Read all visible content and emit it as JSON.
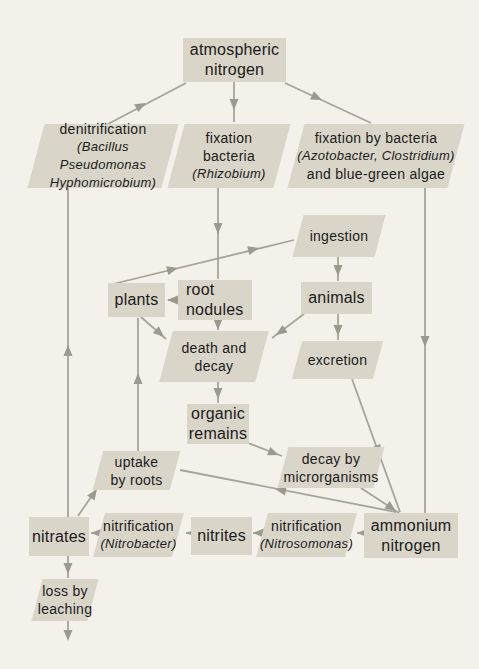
{
  "diagram": {
    "colors": {
      "background": "#f3f1e9",
      "node_fill": "#d9d5c8",
      "line": "#a7a49b",
      "arrowhead": "#9c998f",
      "text": "#1b1b1b"
    },
    "nodes": {
      "atmospheric_nitrogen": {
        "shape": "box",
        "lines": [
          "atmospheric",
          "nitrogen"
        ]
      },
      "denitrification": {
        "shape": "parallelogram",
        "lines": [
          "denitrification",
          "(Bacillus Pseudomonas",
          "Hyphomicrobium)"
        ]
      },
      "fixation_bacteria": {
        "shape": "parallelogram",
        "lines": [
          "fixation",
          "bacteria",
          "(Rhizobium)"
        ]
      },
      "fixation_by_bacteria": {
        "shape": "parallelogram",
        "lines": [
          "fixation by bacteria",
          "(Azotobacter, Clostridium)",
          "and blue-green algae"
        ]
      },
      "ingestion": {
        "shape": "parallelogram",
        "lines": [
          "ingestion"
        ]
      },
      "plants": {
        "shape": "box",
        "lines": [
          "plants"
        ]
      },
      "root_nodules": {
        "shape": "box",
        "lines": [
          "root",
          "nodules"
        ]
      },
      "animals": {
        "shape": "box",
        "lines": [
          "animals"
        ]
      },
      "death_and_decay": {
        "shape": "parallelogram",
        "lines": [
          "death and",
          "decay"
        ]
      },
      "excretion": {
        "shape": "parallelogram",
        "lines": [
          "excretion"
        ]
      },
      "organic_remains": {
        "shape": "box",
        "lines": [
          "organic",
          "remains"
        ]
      },
      "uptake_by_roots": {
        "shape": "parallelogram",
        "lines": [
          "uptake",
          "by roots"
        ]
      },
      "decay_by_microrganisms": {
        "shape": "parallelogram",
        "lines": [
          "decay by",
          "microrganisms"
        ]
      },
      "nitrates": {
        "shape": "box",
        "lines": [
          "nitrates"
        ]
      },
      "nitrification_nitrobacter": {
        "shape": "parallelogram",
        "lines": [
          "nitrification",
          "(Nitrobacter)"
        ]
      },
      "nitrites": {
        "shape": "box",
        "lines": [
          "nitrites"
        ]
      },
      "nitrification_nitrosomonas": {
        "shape": "parallelogram",
        "lines": [
          "nitrification",
          "(Nitrosomonas)"
        ]
      },
      "ammonium_nitrogen": {
        "shape": "box",
        "lines": [
          "ammonium",
          "nitrogen"
        ]
      },
      "loss_by_leaching": {
        "shape": "parallelogram",
        "lines": [
          "loss by",
          "leaching"
        ]
      }
    },
    "edges": [
      {
        "from": "denitrification",
        "to": "atmospheric_nitrogen"
      },
      {
        "from": "atmospheric_nitrogen",
        "to": "fixation_bacteria"
      },
      {
        "from": "atmospheric_nitrogen",
        "to": "fixation_by_bacteria"
      },
      {
        "from": "nitrates",
        "to": "denitrification"
      },
      {
        "from": "fixation_bacteria",
        "to": "root_nodules"
      },
      {
        "from": "fixation_by_bacteria",
        "to": "ammonium_nitrogen"
      },
      {
        "from": "plants",
        "to": "ingestion"
      },
      {
        "from": "ingestion",
        "to": "animals"
      },
      {
        "from": "root_nodules",
        "to": "plants"
      },
      {
        "from": "root_nodules",
        "to": "death_and_decay"
      },
      {
        "from": "plants",
        "to": "death_and_decay"
      },
      {
        "from": "animals",
        "to": "death_and_decay"
      },
      {
        "from": "animals",
        "to": "excretion"
      },
      {
        "from": "excretion",
        "to": "ammonium_nitrogen"
      },
      {
        "from": "death_and_decay",
        "to": "organic_remains"
      },
      {
        "from": "organic_remains",
        "to": "decay_by_microrganisms"
      },
      {
        "from": "decay_by_microrganisms",
        "to": "ammonium_nitrogen"
      },
      {
        "from": "ammonium_nitrogen",
        "to": "uptake_by_roots"
      },
      {
        "from": "uptake_by_roots",
        "to": "plants"
      },
      {
        "from": "nitrates",
        "to": "uptake_by_roots"
      },
      {
        "from": "ammonium_nitrogen",
        "to": "nitrification_nitrosomonas"
      },
      {
        "from": "nitrification_nitrosomonas",
        "to": "nitrites"
      },
      {
        "from": "nitrites",
        "to": "nitrification_nitrobacter"
      },
      {
        "from": "nitrification_nitrobacter",
        "to": "nitrates"
      },
      {
        "from": "nitrates",
        "to": "loss_by_leaching"
      },
      {
        "from": "loss_by_leaching",
        "to": "outflow"
      }
    ]
  }
}
